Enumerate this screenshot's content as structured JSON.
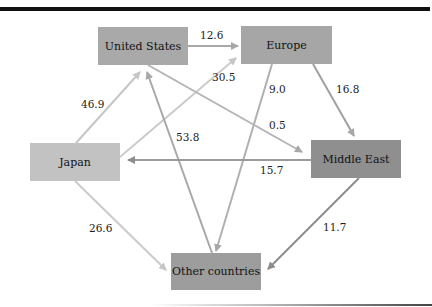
{
  "nodes": {
    "us": {
      "label": "United States",
      "color": "#a9a9a9"
    },
    "eu": {
      "label": "Europe",
      "color": "#a6a6a6"
    },
    "jp": {
      "label": "Japan",
      "color": "#c2c2c2"
    },
    "me": {
      "label": "Middle East",
      "color": "#8f8f8f"
    },
    "oc": {
      "label": "Other countries",
      "color": "#9d9d9d"
    }
  },
  "edges": [
    {
      "from": "United States",
      "to": "Europe",
      "value": "12.6"
    },
    {
      "from": "Japan",
      "to": "Europe",
      "value": "30.5"
    },
    {
      "from": "Japan",
      "to": "United States",
      "value": "46.9"
    },
    {
      "from": "Other countries",
      "to": "United States",
      "value": "53.8"
    },
    {
      "from": "Europe",
      "to": "Other countries",
      "value": "9.0"
    },
    {
      "from": "Europe",
      "to": "Middle East",
      "value": "16.8"
    },
    {
      "from": "United States",
      "to": "Middle East",
      "value": "0.5"
    },
    {
      "from": "Middle East",
      "to": "Japan",
      "value": "15.7"
    },
    {
      "from": "Japan",
      "to": "Other countries",
      "value": "26.6"
    },
    {
      "from": "Middle East",
      "to": "Other countries",
      "value": "11.7"
    }
  ]
}
